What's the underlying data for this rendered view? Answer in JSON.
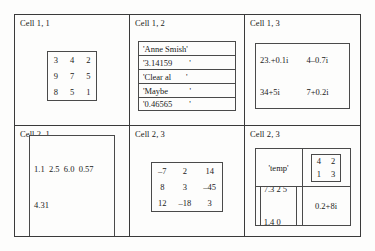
{
  "diagram": {
    "cells": [
      {
        "label": "Cell 1, 1",
        "kind": "matrix",
        "rows": [
          [
            "3",
            "4",
            "2"
          ],
          [
            "9",
            "7",
            "5"
          ],
          [
            "8",
            "5",
            "1"
          ]
        ]
      },
      {
        "label": "Cell 1, 2",
        "kind": "string-list",
        "strings": [
          "'Anne Smish'",
          "'3.14159        '",
          "'Clear al       '",
          "'Maybe          '",
          "'0.46565        '"
        ]
      },
      {
        "label": "Cell 1, 3",
        "kind": "complex-matrix",
        "values": [
          "23.+0.1i",
          "4–0.7i",
          "34+5i",
          "7+0.2i"
        ]
      },
      {
        "label": "Cell 2, 1",
        "kind": "vector",
        "lines": [
          "1.1  2.5  6.0  0.57",
          "4.31"
        ]
      },
      {
        "label": "Cell 2, 3",
        "kind": "matrix",
        "rows": [
          [
            "–7",
            "2",
            "14"
          ],
          [
            "8",
            "3",
            "–45"
          ],
          [
            "12",
            "–18",
            "3"
          ]
        ]
      },
      {
        "label": "Cell 2, 3",
        "kind": "nested-cell-array",
        "nested": {
          "top_left_string": "'temp'",
          "top_right_matrix": [
            [
              "4",
              "2"
            ],
            [
              "1",
              "3"
            ]
          ],
          "bottom_left_vector": [
            "7.3 2 5",
            "1.4 0"
          ],
          "bottom_right_complex": "0.2+8i"
        }
      }
    ]
  }
}
